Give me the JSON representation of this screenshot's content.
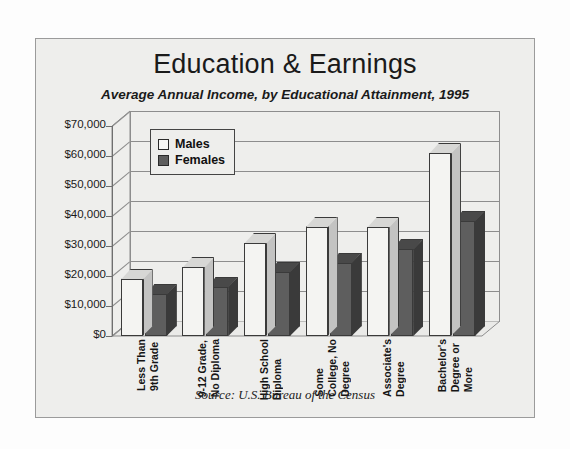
{
  "chart_data": {
    "type": "bar",
    "title": "Education & Earnings",
    "subtitle": "Average Annual Income, by Educational Attainment, 1995",
    "source": "Source:  U.S. Bureau of the Census",
    "xlabel": "",
    "ylabel": "",
    "ylim": [
      0,
      70000
    ],
    "ytick_step": 10000,
    "grid": true,
    "legend_position": "top-left",
    "three_d": true,
    "categories": [
      "Less Than 9th Grade",
      "9-12 Grade, No Diploma",
      "High School Diploma",
      "Some College, No Degree",
      "Associate's Degree",
      "Bachelor's Degree or More"
    ],
    "category_lines": [
      [
        "Less Than",
        "9th Grade"
      ],
      [
        "9-12 Grade,",
        "No Diploma"
      ],
      [
        "High School",
        "Diploma"
      ],
      [
        "Some",
        "College, No",
        "Degree"
      ],
      [
        "Associate's",
        "Degree"
      ],
      [
        "Bachelor's",
        "Degree or",
        "More"
      ]
    ],
    "ytick_labels": [
      "$70,000",
      "$60,000",
      "$50,000",
      "$40,000",
      "$30,000",
      "$20,000",
      "$10,000",
      "$0"
    ],
    "ytick_values": [
      70000,
      60000,
      50000,
      40000,
      30000,
      20000,
      10000,
      0
    ],
    "series": [
      {
        "name": "Males",
        "color": "#f4f4f2",
        "values": [
          19000,
          23000,
          31000,
          36500,
          36500,
          61000
        ]
      },
      {
        "name": "Females",
        "color": "#5e5e5e",
        "values": [
          14000,
          16500,
          21500,
          24500,
          29000,
          38500
        ]
      }
    ]
  },
  "legend": {
    "items": [
      {
        "label": "Males",
        "swatch": "males"
      },
      {
        "label": "Females",
        "swatch": "females"
      }
    ]
  }
}
